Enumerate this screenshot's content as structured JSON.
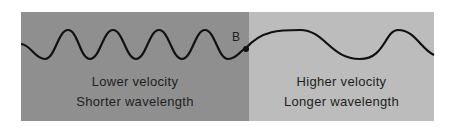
{
  "left_medium": {
    "label_line1": "Lower velocity",
    "label_line2": "Shorter wavelength",
    "color": "#8f8f8f"
  },
  "right_medium": {
    "label_line1": "Higher velocity",
    "label_line2": "Longer wavelength",
    "color": "#bcbcbc"
  },
  "boundary_point": {
    "label": "B"
  }
}
